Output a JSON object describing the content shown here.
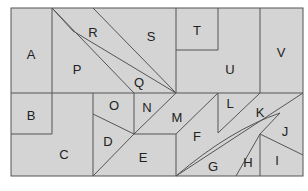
{
  "diagram": {
    "fill": "#d4d4d4",
    "stroke": "#555555",
    "regions": [
      {
        "id": "A",
        "label": "A",
        "x": 31,
        "y": 54
      },
      {
        "id": "B",
        "label": "B",
        "x": 31,
        "y": 115
      },
      {
        "id": "C",
        "label": "C",
        "x": 64,
        "y": 154
      },
      {
        "id": "D",
        "label": "D",
        "x": 108,
        "y": 141
      },
      {
        "id": "E",
        "label": "E",
        "x": 143,
        "y": 157
      },
      {
        "id": "F",
        "label": "F",
        "x": 197,
        "y": 136
      },
      {
        "id": "G",
        "label": "G",
        "x": 213,
        "y": 166
      },
      {
        "id": "H",
        "label": "H",
        "x": 248,
        "y": 162
      },
      {
        "id": "I",
        "label": "I",
        "x": 277,
        "y": 160
      },
      {
        "id": "J",
        "label": "J",
        "x": 285,
        "y": 131
      },
      {
        "id": "K",
        "label": "K",
        "x": 260,
        "y": 112
      },
      {
        "id": "L",
        "label": "L",
        "x": 230,
        "y": 103
      },
      {
        "id": "M",
        "label": "M",
        "x": 177,
        "y": 117
      },
      {
        "id": "N",
        "label": "N",
        "x": 147,
        "y": 107
      },
      {
        "id": "O",
        "label": "O",
        "x": 114,
        "y": 105
      },
      {
        "id": "P",
        "label": "P",
        "x": 77,
        "y": 69
      },
      {
        "id": "Q",
        "label": "Q",
        "x": 139,
        "y": 82
      },
      {
        "id": "R",
        "label": "R",
        "x": 93,
        "y": 32
      },
      {
        "id": "S",
        "label": "S",
        "x": 151,
        "y": 36
      },
      {
        "id": "T",
        "label": "T",
        "x": 197,
        "y": 30
      },
      {
        "id": "U",
        "label": "U",
        "x": 230,
        "y": 69
      },
      {
        "id": "V",
        "label": "V",
        "x": 281,
        "y": 52
      }
    ]
  }
}
